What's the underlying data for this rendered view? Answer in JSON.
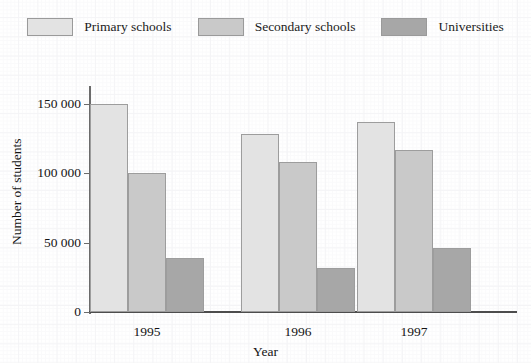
{
  "chart_data": {
    "type": "bar",
    "title": "",
    "xlabel": "Year",
    "ylabel": "Number of students",
    "categories": [
      "1995",
      "1996",
      "1997"
    ],
    "series": [
      {
        "name": "Primary schools",
        "values": [
          150000,
          128000,
          137000
        ],
        "color": "#e3e3e3"
      },
      {
        "name": "Secondary schools",
        "values": [
          100000,
          108000,
          117000
        ],
        "color": "#c9c9c9"
      },
      {
        "name": "Universities",
        "values": [
          39000,
          32000,
          46000
        ],
        "color": "#a7a7a7"
      }
    ],
    "ylim": [
      0,
      160000
    ],
    "ytick_values": [
      0,
      50000,
      100000,
      150000
    ],
    "ytick_labels": [
      "0",
      "50 000",
      "100 000",
      "150 000"
    ],
    "grid": false,
    "legend_position": "top"
  },
  "legend": {
    "entries": [
      {
        "label": "Primary schools"
      },
      {
        "label": "Secondary schools"
      },
      {
        "label": "Universities"
      }
    ]
  },
  "axes": {
    "y_title": "Number of students",
    "x_title": "Year"
  }
}
